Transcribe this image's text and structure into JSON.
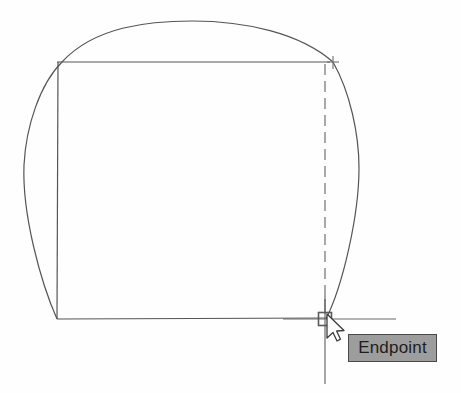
{
  "application": {
    "name": "cad-drawing-canvas",
    "background_color": "#fefefe",
    "line_color": "#4a4a4a",
    "description": "CAD viewport showing a rectangle with an arc and a vertical tracking line with an Endpoint object snap"
  },
  "tooltip": {
    "label": "Endpoint",
    "background_color": "#9d9d9d",
    "border_color": "#4a4a4a",
    "text_color": "#1d1d1d",
    "x": 348,
    "y": 334,
    "width": 89,
    "height": 28
  },
  "cursor": {
    "name": "arrow-pointer",
    "tip_x": 327,
    "tip_y": 314
  },
  "snap_marker": {
    "name": "endpoint-snap-square",
    "shape": "square",
    "center_x": 325,
    "center_y": 319,
    "size": 13,
    "color": "#5a5a5a"
  },
  "crosshair": {
    "name": "tracking-crosshair",
    "center_x": 325,
    "center_y": 319,
    "horizontal_from_x": 283,
    "horizontal_to_x": 396,
    "vertical_from_y": 296,
    "vertical_to_y": 384,
    "color": "#6a6a6a"
  },
  "geometry": {
    "rectangle": {
      "name": "rectangle-outline",
      "left": 57,
      "top": 62,
      "right": 325,
      "bottom": 319,
      "color": "#555555"
    },
    "arc_top": {
      "name": "top-arc",
      "start_x": 62,
      "start_y": 62,
      "end_x": 333,
      "end_y": 62,
      "apex_x": 192,
      "apex_y": 21,
      "color": "#555555"
    },
    "arc_left": {
      "name": "left-arc",
      "start_x": 62,
      "start_y": 62,
      "end_x": 57,
      "end_y": 319,
      "bulge_x": 24,
      "bulge_y": 165,
      "color": "#555555"
    },
    "arc_right": {
      "name": "right-arc",
      "start_x": 333,
      "start_y": 62,
      "end_x": 326,
      "end_y": 319,
      "bulge_x": 359,
      "bulge_y": 168,
      "color": "#555555"
    },
    "tracking_line": {
      "name": "vertical-tracking-line",
      "x": 325,
      "from_y": 62,
      "to_y": 300,
      "style": "dashed",
      "dash_length": 11,
      "gap_length": 6,
      "color": "#7a7a7a"
    },
    "top_endpoint_marker": {
      "name": "top-endpoint-cross-marker",
      "center_x": 333,
      "center_y": 62,
      "size": 9,
      "color": "#6e6e6e"
    }
  }
}
